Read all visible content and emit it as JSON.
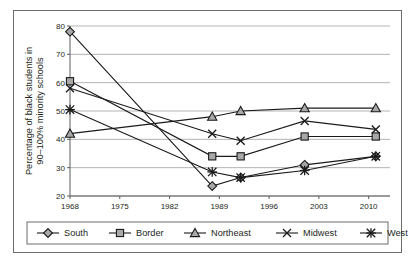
{
  "chart_data": {
    "type": "line",
    "title": "",
    "xlabel": "",
    "ylabel": "Percentage of black students in 90–100% minority schools",
    "ylabel_lines": [
      "Percentage of black students in",
      "90–100% minority schools"
    ],
    "x": [
      1968,
      1988,
      1992,
      2001,
      2011
    ],
    "xlim": [
      1968,
      2013
    ],
    "ylim": [
      20,
      80
    ],
    "xticks": [
      1968,
      1975,
      1982,
      1989,
      1996,
      2003,
      2010
    ],
    "xtick_labels": [
      "1968",
      "1975",
      "1982",
      "1989",
      "1996",
      "2003",
      "2010"
    ],
    "yticks": [
      20,
      30,
      40,
      50,
      60,
      70,
      80
    ],
    "ytick_labels": [
      "20",
      "30",
      "40",
      "50",
      "60",
      "70",
      "80"
    ],
    "grid": "horizontal",
    "legend_position": "bottom",
    "series": [
      {
        "name": "South",
        "marker": "diamond",
        "values": [
          78,
          23.5,
          26.5,
          31,
          34
        ]
      },
      {
        "name": "Border",
        "marker": "square",
        "values": [
          60.5,
          34,
          34,
          41,
          41
        ]
      },
      {
        "name": "Northeast",
        "marker": "triangle",
        "values": [
          42,
          48,
          50,
          51,
          51
        ]
      },
      {
        "name": "Midwest",
        "marker": "cross",
        "values": [
          58,
          42,
          39.5,
          46.5,
          43.5
        ]
      },
      {
        "name": "West",
        "marker": "asterisk",
        "values": [
          50.5,
          28.5,
          26.5,
          29,
          34
        ]
      }
    ]
  },
  "colors": {
    "marker_fill": "#a8a8a8",
    "line": "#1a1a1a",
    "gridline": "#b3b3b3",
    "axis": "#5c5c5c",
    "frame": "#6c6c6c",
    "text": "#231f20",
    "background": "#ffffff"
  }
}
